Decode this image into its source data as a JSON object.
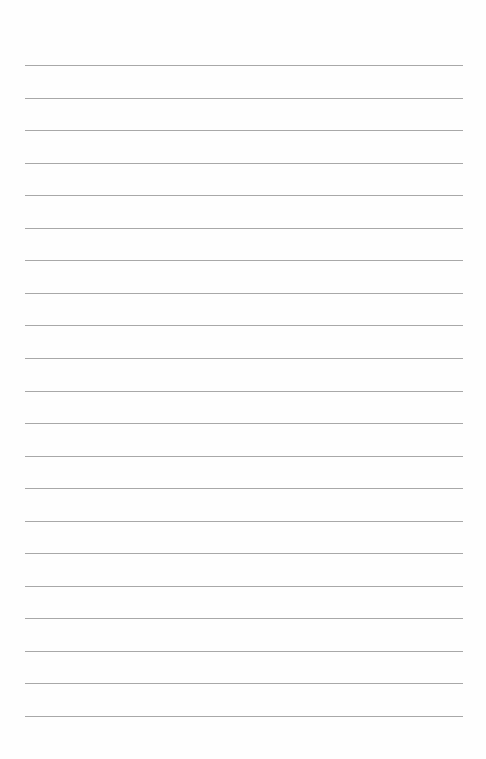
{
  "page": {
    "type": "lined-paper",
    "background_color": "#fefefe",
    "rule_color": "#a8a8a8",
    "rule_count": 21,
    "rule_left": 25,
    "rule_right": 463,
    "first_rule_y": 65,
    "rule_spacing": 32.55
  }
}
